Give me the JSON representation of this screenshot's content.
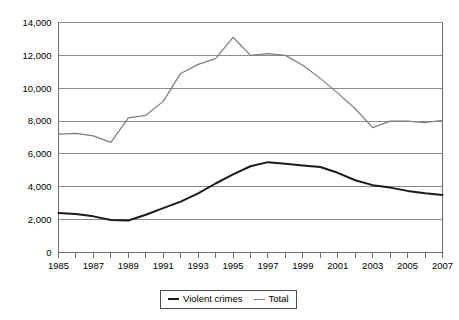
{
  "chart_data": {
    "type": "line",
    "title": "",
    "subtitle": "",
    "xlabel": "",
    "ylabel": "",
    "grid": true,
    "legend_position": "bottom-center",
    "x": [
      1985,
      1986,
      1987,
      1988,
      1989,
      1990,
      1991,
      1992,
      1993,
      1994,
      1995,
      1996,
      1997,
      1998,
      1999,
      2000,
      2001,
      2002,
      2003,
      2004,
      2005,
      2006,
      2007
    ],
    "categories": [
      "1985",
      "1986",
      "1987",
      "1988",
      "1989",
      "1990",
      "1991",
      "1992",
      "1993",
      "1994",
      "1995",
      "1996",
      "1997",
      "1998",
      "1999",
      "2000",
      "2001",
      "2002",
      "2003",
      "2004",
      "2005",
      "2006",
      "2007"
    ],
    "xtick_labels": [
      "1985",
      "1987",
      "1989",
      "1991",
      "1993",
      "1995",
      "1997",
      "1999",
      "2001",
      "2003",
      "2005",
      "2007"
    ],
    "xtick_values": [
      1985,
      1987,
      1989,
      1991,
      1993,
      1995,
      1997,
      1999,
      2001,
      2003,
      2005,
      2007
    ],
    "xlim": [
      1985,
      2007
    ],
    "ylim": [
      0,
      14000
    ],
    "ytick_labels": [
      "0",
      "2,000",
      "4,000",
      "6,000",
      "8,000",
      "10,000",
      "12,000",
      "14,000"
    ],
    "ytick_values": [
      0,
      2000,
      4000,
      6000,
      8000,
      10000,
      12000,
      14000
    ],
    "series": [
      {
        "name": "Violent crimes",
        "color": "#1a1a1a",
        "values": [
          2400,
          2350,
          2200,
          1980,
          1950,
          2300,
          2700,
          3100,
          3600,
          4200,
          4750,
          5250,
          5500,
          5400,
          5300,
          5200,
          4850,
          4400,
          4100,
          3950,
          3750,
          3600,
          3500
        ]
      },
      {
        "name": "Total",
        "color": "#7d7d7d",
        "values": [
          7200,
          7250,
          7100,
          6700,
          8200,
          8350,
          9200,
          10900,
          11450,
          11800,
          13100,
          12000,
          12100,
          12000,
          11400,
          10600,
          9700,
          8750,
          7600,
          8000,
          8000,
          7900,
          8050
        ]
      }
    ],
    "legend": [
      {
        "label": "Violent crimes",
        "color": "#1a1a1a"
      },
      {
        "label": "Total",
        "color": "#7d7d7d"
      }
    ]
  }
}
